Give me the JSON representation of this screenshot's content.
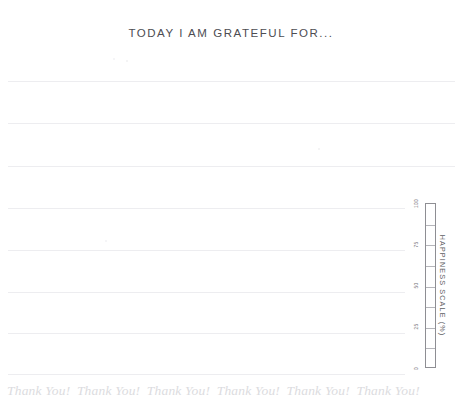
{
  "page": {
    "title": "TODAY I AM GRATEFUL FOR...",
    "background_color": "#ffffff",
    "title_color": "#4d4d52",
    "line_color": "#ededf0",
    "footer_color": "#dcdce0",
    "scale_border_color": "#8e8e93"
  },
  "writing_lines": [
    {
      "y": 81,
      "left": 8,
      "width": 447
    },
    {
      "y": 123,
      "left": 8,
      "width": 447
    },
    {
      "y": 166,
      "left": 8,
      "width": 447
    },
    {
      "y": 208,
      "left": 8,
      "width": 397
    },
    {
      "y": 250,
      "left": 8,
      "width": 397
    },
    {
      "y": 292,
      "left": 8,
      "width": 397
    },
    {
      "y": 333,
      "left": 8,
      "width": 397
    },
    {
      "y": 374,
      "left": 8,
      "width": 397
    }
  ],
  "happiness_scale": {
    "axis_label": "HAPPINESS SCALE (%)",
    "ticks": [
      {
        "label": "100",
        "value": 100
      },
      {
        "label": "75",
        "value": 75
      },
      {
        "label": "50",
        "value": 50
      },
      {
        "label": "25",
        "value": 25
      },
      {
        "label": "0",
        "value": 0
      }
    ],
    "min": 0,
    "max": 100,
    "segments": 8,
    "filled": 0
  },
  "footer": {
    "items": [
      "Thank You!",
      "Thank You!",
      "Thank You!",
      "Thank You!",
      "Thank You!",
      "Thank You!"
    ]
  },
  "chart_data": {
    "type": "bar",
    "title": "HAPPINESS SCALE (%)",
    "xlabel": "",
    "ylabel": "HAPPINESS SCALE (%)",
    "categories": [
      "Happiness"
    ],
    "values": [
      0
    ],
    "ylim": [
      0,
      100
    ],
    "tick_labels": [
      "100",
      "75",
      "50",
      "25",
      "0"
    ],
    "grid": true,
    "legend": "none",
    "orientation": "vertical"
  }
}
